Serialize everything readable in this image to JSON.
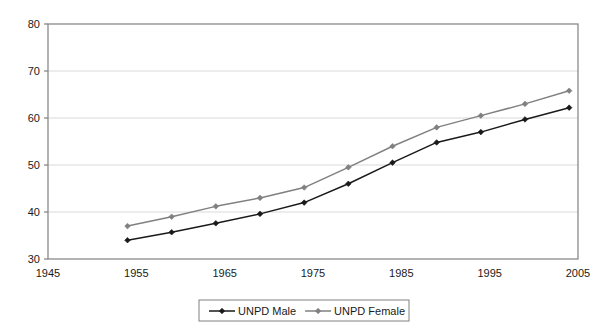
{
  "chart_data": {
    "type": "line",
    "title": "",
    "subtitle": "",
    "xlabel": "",
    "ylabel": "",
    "xlim": [
      1945,
      2005
    ],
    "ylim": [
      30,
      80
    ],
    "xticks": [
      1945,
      1955,
      1965,
      1975,
      1985,
      1995,
      2005
    ],
    "yticks": [
      30,
      40,
      50,
      60,
      70,
      80
    ],
    "xtick_labels": [
      "1945",
      "1955",
      "1965",
      "1975",
      "1985",
      "1995",
      "2005"
    ],
    "ytick_labels": [
      "30",
      "40",
      "50",
      "60",
      "70",
      "80"
    ],
    "grid": {
      "horizontal": true,
      "vertical": false
    },
    "legend_position": "bottom",
    "x": [
      1954,
      1959,
      1964,
      1969,
      1974,
      1979,
      1984,
      1989,
      1994,
      1999,
      2004
    ],
    "series": [
      {
        "name": "UNPD Male",
        "color": "#1a1a1a",
        "marker": "diamond",
        "values": [
          34.0,
          35.7,
          37.6,
          39.6,
          42.0,
          46.0,
          50.5,
          54.8,
          57.0,
          59.7,
          62.2
        ]
      },
      {
        "name": "UNPD Female",
        "color": "#808080",
        "marker": "diamond",
        "values": [
          37.0,
          39.0,
          41.2,
          43.0,
          45.2,
          49.5,
          54.0,
          58.0,
          60.5,
          63.0,
          65.8
        ]
      }
    ]
  },
  "legend": {
    "items": [
      {
        "label": "UNPD Male",
        "color": "#1a1a1a"
      },
      {
        "label": "UNPD Female",
        "color": "#808080"
      }
    ]
  },
  "colors": {
    "male": "#1a1a1a",
    "female": "#808080",
    "axis": "#808080",
    "grid": "#d9d9d9",
    "background": "#ffffff"
  }
}
